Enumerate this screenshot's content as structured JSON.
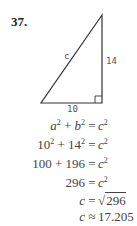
{
  "problem": {
    "number": "37."
  },
  "figure": {
    "type": "right-triangle",
    "vertices": {
      "top": [
        102,
        15
      ],
      "bottom_left": [
        41,
        103
      ],
      "right_angle": [
        102,
        103
      ]
    },
    "labels": {
      "hypotenuse": "c",
      "vertical_leg": "14",
      "horizontal_leg": "10"
    },
    "right_angle_marker": true
  },
  "equations": [
    {
      "lhs_parts": [
        "a",
        "2",
        " + ",
        "b",
        "2"
      ],
      "lhs_text": "a² + b²",
      "eq": "=",
      "rhs_text": "c²"
    },
    {
      "lhs_text": "10² + 14²",
      "eq": "=",
      "rhs_text": "c²"
    },
    {
      "lhs_text": "100 + 196",
      "eq": "=",
      "rhs_text": "c²"
    },
    {
      "lhs_text": "296",
      "eq": "=",
      "rhs_text": "c²"
    },
    {
      "lhs_text": "c",
      "eq": "=",
      "rhs_text": "√296",
      "radicand": "296"
    },
    {
      "lhs_text": "c",
      "eq": "≈",
      "rhs_text": "17.205"
    }
  ],
  "colors": {
    "line": "#333333",
    "text": "#444444",
    "label": "#555555"
  }
}
